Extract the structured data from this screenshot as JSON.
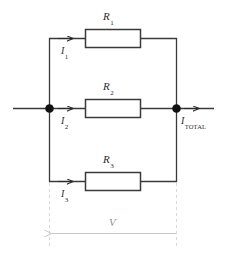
{
  "diagram": {
    "type": "electrical-schematic",
    "background_color": "#ffffff",
    "wire_color": "#3a3a3a",
    "node_color": "#111111",
    "dim_color": "#c9c9c9",
    "dim_text_color": "#8f8f8f",
    "resistors": [
      {
        "id": "R1",
        "label": "R",
        "subscript": "1",
        "branch": "top"
      },
      {
        "id": "R2",
        "label": "R",
        "subscript": "2",
        "branch": "middle"
      },
      {
        "id": "R3",
        "label": "R",
        "subscript": "3",
        "branch": "bottom"
      }
    ],
    "currents": [
      {
        "id": "I1",
        "label": "I",
        "subscript": "1",
        "branch": "top",
        "direction": "right"
      },
      {
        "id": "I2",
        "label": "I",
        "subscript": "2",
        "branch": "middle",
        "direction": "right"
      },
      {
        "id": "I3",
        "label": "I",
        "subscript": "3",
        "branch": "bottom",
        "direction": "right"
      },
      {
        "id": "ITOTAL",
        "label": "I",
        "subscript": "TOTAL",
        "branch": "output",
        "direction": "right"
      }
    ],
    "voltage": {
      "label": "V",
      "direction": "left",
      "style": "dimension-arrow"
    }
  }
}
